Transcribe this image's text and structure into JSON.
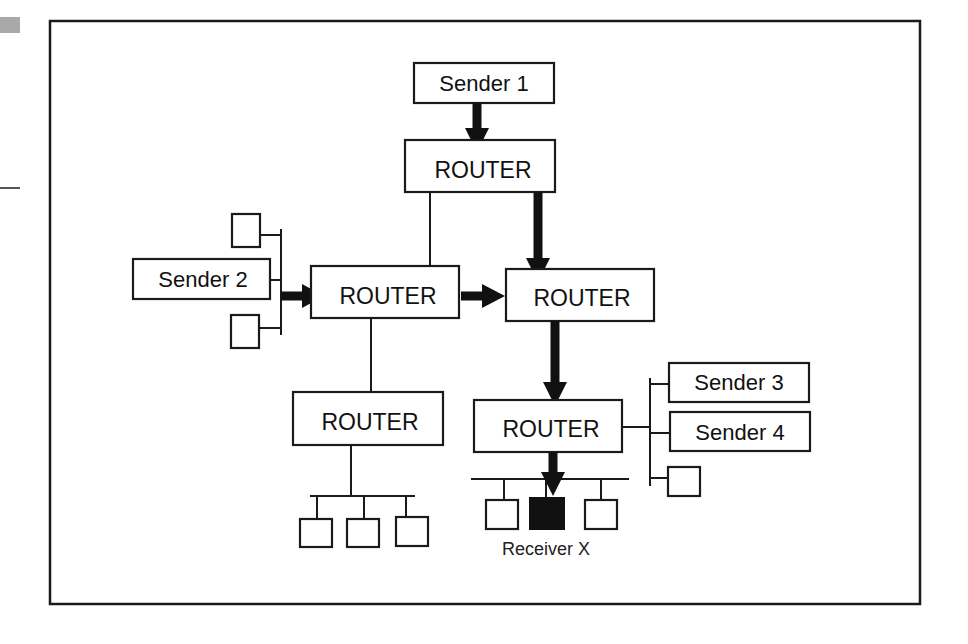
{
  "diagram": {
    "frame": {
      "x": 50,
      "y": 21,
      "w": 870,
      "h": 583
    },
    "senders": [
      {
        "id": "sender1",
        "label": "Sender 1"
      },
      {
        "id": "sender2",
        "label": "Sender 2"
      },
      {
        "id": "sender3",
        "label": "Sender 3"
      },
      {
        "id": "sender4",
        "label": "Sender 4"
      }
    ],
    "routers": [
      {
        "id": "router-top",
        "label": "ROUTER"
      },
      {
        "id": "router-left",
        "label": "ROUTER"
      },
      {
        "id": "router-center",
        "label": "ROUTER"
      },
      {
        "id": "router-bottom-left",
        "label": "ROUTER"
      },
      {
        "id": "router-bottom-right",
        "label": "ROUTER"
      }
    ],
    "receiver": {
      "label": "Receiver X",
      "color": "#111111"
    },
    "flow_path": [
      "Sender 1",
      "ROUTER (top)",
      "ROUTER (center)",
      "ROUTER (bottom-right)",
      "Receiver X"
    ],
    "flow_path_2": [
      "Sender 2",
      "ROUTER (left)",
      "ROUTER (center)"
    ],
    "colors": {
      "stroke": "#1a1a1a",
      "background": "#ffffff",
      "receiver_fill": "#111111"
    }
  }
}
